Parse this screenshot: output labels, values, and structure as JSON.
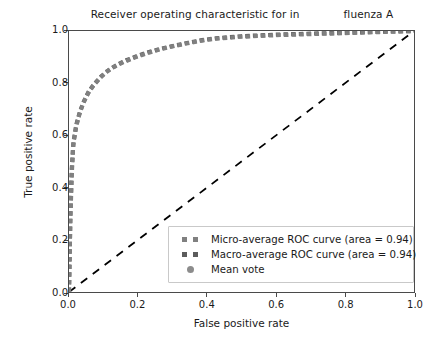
{
  "figure": {
    "title_part1": "Receiver operating characteristic for in",
    "title_part2": "fluenza A",
    "width": 439,
    "height": 340
  },
  "chart_data": {
    "type": "line",
    "xlabel": "False positive rate",
    "ylabel": "True positive rate",
    "xlim": [
      0.0,
      1.0
    ],
    "ylim": [
      0.0,
      1.0
    ],
    "xticks": [
      "0.0",
      "0.2",
      "0.4",
      "0.6",
      "0.8",
      "1.0"
    ],
    "yticks": [
      "0.0",
      "0.2",
      "0.4",
      "0.6",
      "0.8",
      "1.0"
    ],
    "grid": false,
    "legend_position": "lower right",
    "series": [
      {
        "name": "Micro-average ROC curve (area = 0.94)",
        "marker": "dashed-square",
        "color": "#808080",
        "area": 0.94,
        "x": [
          0.0,
          0.004,
          0.008,
          0.012,
          0.02,
          0.03,
          0.04,
          0.055,
          0.07,
          0.09,
          0.11,
          0.13,
          0.16,
          0.19,
          0.22,
          0.26,
          0.3,
          0.34,
          0.38,
          0.42,
          0.5,
          0.6,
          0.7,
          0.8,
          0.9,
          1.0
        ],
        "y": [
          0.0,
          0.28,
          0.45,
          0.56,
          0.63,
          0.68,
          0.72,
          0.76,
          0.79,
          0.82,
          0.845,
          0.862,
          0.882,
          0.898,
          0.912,
          0.928,
          0.941,
          0.952,
          0.962,
          0.97,
          0.978,
          0.984,
          0.988,
          0.992,
          0.996,
          1.0
        ]
      },
      {
        "name": "Macro-average ROC curve (area = 0.94)",
        "marker": "dashed-square",
        "color": "#5c5c5c",
        "area": 0.94,
        "x": [
          0.0,
          0.004,
          0.008,
          0.013,
          0.022,
          0.032,
          0.043,
          0.058,
          0.074,
          0.094,
          0.115,
          0.136,
          0.166,
          0.196,
          0.226,
          0.266,
          0.306,
          0.346,
          0.386,
          0.426,
          0.5,
          0.6,
          0.7,
          0.8,
          0.9,
          1.0
        ],
        "y": [
          0.0,
          0.3,
          0.47,
          0.575,
          0.645,
          0.692,
          0.73,
          0.77,
          0.798,
          0.827,
          0.85,
          0.868,
          0.888,
          0.903,
          0.917,
          0.932,
          0.944,
          0.955,
          0.965,
          0.972,
          0.98,
          0.986,
          0.99,
          0.993,
          0.997,
          1.0
        ]
      },
      {
        "name": "Mean vote",
        "marker": "circle",
        "color": "#8c8c8c",
        "x": [],
        "y": []
      },
      {
        "name": "chance-diagonal",
        "marker": "dashed-line",
        "color": "#000000",
        "x": [
          0.0,
          1.0
        ],
        "y": [
          0.0,
          1.0
        ]
      }
    ]
  },
  "legend": {
    "items": [
      {
        "label": "Micro-average ROC curve (area = 0.94)",
        "marker": "dashed-square",
        "color": "#808080"
      },
      {
        "label": "Macro-average ROC curve (area = 0.94)",
        "marker": "dashed-square",
        "color": "#5c5c5c"
      },
      {
        "label": "Mean vote",
        "marker": "circle",
        "color": "#8c8c8c"
      }
    ]
  },
  "axes": {
    "xlabel": "False positive rate",
    "ylabel": "True positive rate",
    "xticks": [
      "0.0",
      "0.2",
      "0.4",
      "0.6",
      "0.8",
      "1.0"
    ],
    "yticks": [
      "0.0",
      "0.2",
      "0.4",
      "0.6",
      "0.8",
      "1.0"
    ]
  }
}
